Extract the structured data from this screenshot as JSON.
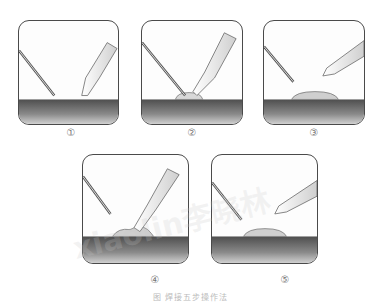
{
  "figure": {
    "steps": [
      {
        "label": "①",
        "description": "iron and solder approach"
      },
      {
        "label": "②",
        "description": "heat joint, feed solder"
      },
      {
        "label": "③",
        "description": "remove solder wire"
      },
      {
        "label": "④",
        "description": "solder flows around joint"
      },
      {
        "label": "⑤",
        "description": "remove iron"
      }
    ],
    "caption": "图  焊接五步操作法",
    "watermark": "xiaolin李晓林",
    "colors": {
      "frame_border": "#4a4a4a",
      "board_dark": "#5a5a5a",
      "board_light": "#b8b8b8",
      "solder": "#cfcfcf",
      "label": "#777777"
    }
  }
}
